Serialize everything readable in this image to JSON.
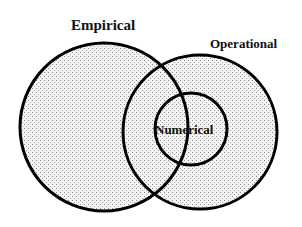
{
  "diagram": {
    "type": "venn",
    "sets": [
      {
        "id": "empirical",
        "label": "Empirical"
      },
      {
        "id": "operational",
        "label": "Operational"
      },
      {
        "id": "numerical",
        "label": "Numerical",
        "subset_of": "operational",
        "overlaps": "empirical"
      }
    ],
    "fill_pattern": "stippled-dots",
    "colors": {
      "stroke": "#000000",
      "fill_background": "#f4f4f4",
      "dot": "#8a8a8a",
      "text": "#111111"
    }
  }
}
